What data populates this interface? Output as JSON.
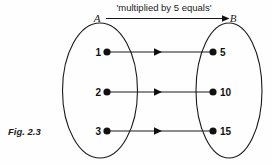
{
  "figure": {
    "caption": "Fig. 2.3",
    "relation_label": "'multiplied by 5 equals'",
    "domain_set": {
      "name": "A",
      "elements": [
        {
          "value": "1",
          "y": 52
        },
        {
          "value": "2",
          "y": 92
        },
        {
          "value": "3",
          "y": 131
        }
      ]
    },
    "codomain_set": {
      "name": "B",
      "elements": [
        {
          "value": "5",
          "y": 52
        },
        {
          "value": "10",
          "y": 92
        },
        {
          "value": "15",
          "y": 131
        }
      ]
    },
    "mappings": [
      {
        "from": "1",
        "to": "5"
      },
      {
        "from": "2",
        "to": "10"
      },
      {
        "from": "3",
        "to": "15"
      }
    ],
    "colors": {
      "ink": "#1a1a1a",
      "background": "#fefefe"
    }
  }
}
